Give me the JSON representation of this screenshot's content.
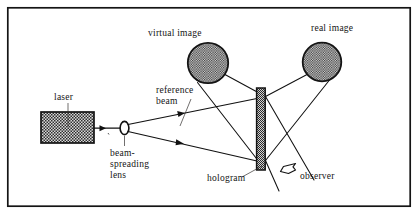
{
  "figure": {
    "domain": "Diagram",
    "canvas": {
      "width": 418,
      "height": 217
    },
    "border": {
      "name": "figure-border",
      "x": 7,
      "y": 7,
      "width": 404,
      "height": 200,
      "stroke": "#141414",
      "stroke_width": 1.6
    },
    "colors": {
      "ink": "#141414",
      "ray": "#111111",
      "leader": "#33312f",
      "background": "#ffffff",
      "stipple_fill": "#cfcfcf",
      "stipple_dot": "#303030"
    }
  },
  "labels": {
    "virtual_image": "virtual image",
    "real_image": "real image",
    "laser": "laser",
    "reference_beam_line1": "reference",
    "reference_beam_line2": "beam",
    "lens_line1": "beam-",
    "lens_line2": "spreading",
    "lens_line3": "lens",
    "hologram": "hologram",
    "observer": "observer"
  },
  "parts": {
    "laser_box": {
      "name": "laser-box",
      "x": 41,
      "y": 112,
      "width": 53,
      "height": 31
    },
    "lens": {
      "name": "beam-spreading-lens",
      "cx": 124,
      "cy": 128,
      "rx": 4.2,
      "ry": 6.4
    },
    "hologram_plate": {
      "name": "hologram-plate",
      "x": 256.5,
      "y": 88,
      "width": 8.5,
      "height": 82
    },
    "virtual_image_circle": {
      "name": "virtual-image-circle",
      "cx": 208,
      "cy": 63,
      "r": 20.5
    },
    "real_image_circle": {
      "name": "real-image-circle",
      "cx": 322,
      "cy": 62,
      "r": 19.5
    },
    "observer_eye": {
      "name": "observer-eye-icon",
      "cx": 288,
      "cy": 168
    }
  },
  "rays": {
    "laser_output": {
      "name": "ray-laser-to-lens",
      "x1": 94,
      "y1": 128,
      "x2": 120,
      "y2": 128
    },
    "upper_reference": {
      "name": "ray-reference-upper",
      "x1": 127,
      "y1": 125,
      "x2": 256,
      "y2": 99
    },
    "lower_reference": {
      "name": "ray-reference-lower",
      "x1": 127,
      "y1": 132,
      "x2": 256,
      "y2": 161
    },
    "virtual_upper": {
      "name": "ray-virtual-upper",
      "x1": 223,
      "y1": 75,
      "x2": 265,
      "y2": 97
    },
    "virtual_lower": {
      "name": "ray-virtual-lower",
      "x1": 199,
      "y1": 82,
      "x2": 258,
      "y2": 160
    },
    "real_upper": {
      "name": "ray-real-upper",
      "x1": 309,
      "y1": 74,
      "x2": 265,
      "y2": 97
    },
    "real_lower": {
      "name": "ray-real-lower",
      "x1": 330,
      "y1": 78,
      "x2": 265,
      "y2": 160
    },
    "exit_lower_right": {
      "name": "ray-exit-lower-right",
      "x1": 265,
      "y1": 97,
      "x2": 312,
      "y2": 178
    },
    "exit_upper_right": {
      "name": "ray-exit-upper-right",
      "x1": 265,
      "y1": 161,
      "x2": 278,
      "y2": 190
    }
  },
  "arrowheads": [
    {
      "name": "arrow-laser-beam",
      "x": 112,
      "y": 128,
      "angle": 0
    },
    {
      "name": "arrow-reference-upper",
      "x": 180,
      "y": 114,
      "angle": -11.5
    },
    {
      "name": "arrow-reference-lower",
      "x": 178,
      "y": 143,
      "angle": 12.7
    }
  ],
  "label_positions": {
    "virtual_image": {
      "x": 148,
      "y": 36,
      "anchor": "start"
    },
    "real_image": {
      "x": 311,
      "y": 31,
      "anchor": "start"
    },
    "laser": {
      "x": 55,
      "y": 100,
      "anchor": "start"
    },
    "reference_beam": {
      "x": 156,
      "y": 93,
      "anchor": "start"
    },
    "lens": {
      "x": 110,
      "y": 155,
      "anchor": "start"
    },
    "hologram": {
      "x": 208,
      "y": 183,
      "anchor": "start"
    },
    "observer": {
      "x": 301,
      "y": 180,
      "anchor": "start"
    }
  },
  "leader_lines": {
    "laser": {
      "name": "leader-laser",
      "x1": 68,
      "y1": 103,
      "x2": 68,
      "y2": 128
    },
    "reference_beam": {
      "name": "leader-reference-beam",
      "x1": 190,
      "y1": 98,
      "x2": 179,
      "y2": 125
    },
    "lens": {
      "name": "leader-lens",
      "x1": 124,
      "y1": 137,
      "x2": 124,
      "y2": 146
    },
    "hologram": {
      "name": "leader-hologram",
      "x1": 245,
      "y1": 176,
      "x2": 263,
      "y2": 166
    }
  }
}
